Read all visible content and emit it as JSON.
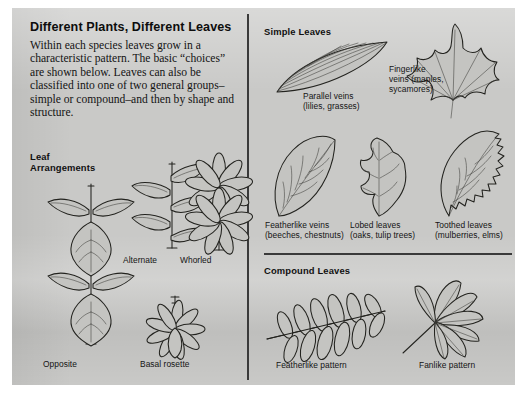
{
  "page": {
    "title": "Different Plants, Different Leaves",
    "intro": "Within each species leaves grow in a characteristic pattern. The basic “choices” are shown below. Leaves can also be classified into one of two general groups–simple or compound–and then by shape and structure.",
    "background_color": "#c9c9c7",
    "ink_color": "#23231f"
  },
  "left_panel": {
    "heading": "Leaf\nArrangements",
    "heading_line1": "Leaf",
    "heading_line2": "Arrangements",
    "items": [
      {
        "label": "Opposite",
        "figure": "opposite-arrangement"
      },
      {
        "label": "Alternate",
        "figure": "alternate-arrangement"
      },
      {
        "label": "Whorled",
        "figure": "whorled-arrangement"
      },
      {
        "label": "Basal rosette",
        "figure": "basal-rosette-arrangement"
      }
    ]
  },
  "right_panel": {
    "simple": {
      "heading": "Simple Leaves",
      "items": [
        {
          "label_line1": "Parallel veins",
          "label_line2": "(lilies, grasses)",
          "figure": "parallel-vein-leaf"
        },
        {
          "label_line1": "Fingerlike",
          "label_line2": "veins (maples,",
          "label_line3": "sycamores)",
          "figure": "fingerlike-vein-leaf"
        },
        {
          "label_line1": "Featherlike veins",
          "label_line2": "(beeches, chestnuts)",
          "figure": "featherlike-vein-leaf"
        },
        {
          "label_line1": "Lobed leaves",
          "label_line2": "(oaks, tulip trees)",
          "figure": "lobed-leaf"
        },
        {
          "label_line1": "Toothed leaves",
          "label_line2": "(mulberries, elms)",
          "figure": "toothed-leaf"
        }
      ]
    },
    "compound": {
      "heading": "Compound Leaves",
      "items": [
        {
          "label": "Featherlike pattern",
          "figure": "pinnate-compound-leaf"
        },
        {
          "label": "Fanlike pattern",
          "figure": "palmate-compound-leaf"
        }
      ]
    }
  }
}
